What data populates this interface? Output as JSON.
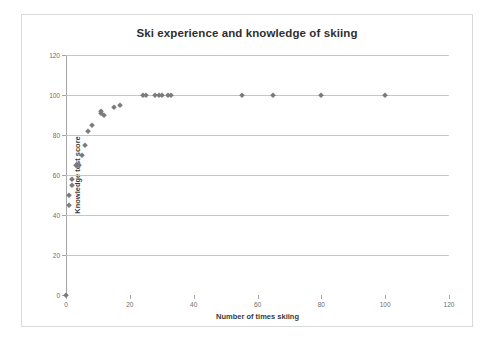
{
  "chart_data": {
    "type": "scatter",
    "title": "Ski experience and knowledge of skiing",
    "xlabel": "Number of times skiing",
    "ylabel": "Knowledge test score",
    "xlim": [
      0,
      120
    ],
    "ylim": [
      0,
      120
    ],
    "xticks": [
      0,
      20,
      40,
      60,
      80,
      100,
      120
    ],
    "yticks": [
      0,
      20,
      40,
      60,
      80,
      100,
      120
    ],
    "grid": "horizontal",
    "legend": "none",
    "marker": "diamond",
    "marker_color": "#7b7b7b",
    "series": [
      {
        "name": "Knowledge test score",
        "points": [
          [
            0,
            0
          ],
          [
            1,
            45
          ],
          [
            1,
            50
          ],
          [
            2,
            55
          ],
          [
            2,
            58
          ],
          [
            3,
            65
          ],
          [
            4,
            65
          ],
          [
            5,
            70
          ],
          [
            6,
            75
          ],
          [
            7,
            82
          ],
          [
            8,
            85
          ],
          [
            11,
            91
          ],
          [
            11,
            92
          ],
          [
            12,
            90
          ],
          [
            15,
            94
          ],
          [
            17,
            95
          ],
          [
            24,
            100
          ],
          [
            25,
            100
          ],
          [
            28,
            100
          ],
          [
            29,
            100
          ],
          [
            30,
            100
          ],
          [
            32,
            100
          ],
          [
            33,
            100
          ],
          [
            55,
            100
          ],
          [
            65,
            100
          ],
          [
            80,
            100
          ],
          [
            100,
            100
          ]
        ]
      }
    ]
  }
}
